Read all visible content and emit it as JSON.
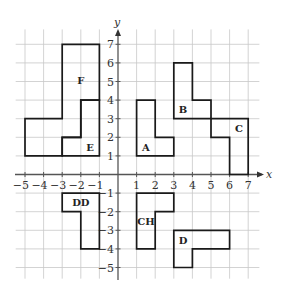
{
  "diagram": {
    "type": "coordinate-grid",
    "x_axis": {
      "label": "x",
      "ticks": [
        -5,
        -4,
        -3,
        -2,
        -1,
        1,
        2,
        3,
        4,
        5,
        6,
        7
      ]
    },
    "y_axis": {
      "label": "y",
      "ticks": [
        7,
        6,
        5,
        4,
        3,
        2,
        1,
        -1,
        -2,
        -3,
        -4,
        -5
      ]
    },
    "grid_range": {
      "xmin": -5.5,
      "xmax": 7.6,
      "ymin": -5.6,
      "ymax": 7.8
    },
    "shapes": [
      {
        "name": "F",
        "label": "F",
        "points": [
          [
            -5,
            1
          ],
          [
            -5,
            3
          ],
          [
            -3,
            3
          ],
          [
            -3,
            7
          ],
          [
            -1,
            7
          ],
          [
            -1,
            4
          ],
          [
            -2,
            4
          ],
          [
            -2,
            2
          ],
          [
            -3,
            2
          ],
          [
            -3,
            1
          ]
        ],
        "label_pos": [
          -2,
          5.1
        ]
      },
      {
        "name": "E",
        "label": "E",
        "points": [
          [
            -3,
            1
          ],
          [
            -3,
            2
          ],
          [
            -2,
            2
          ],
          [
            -2,
            4
          ],
          [
            -1,
            4
          ],
          [
            -1,
            1
          ]
        ],
        "label_pos": [
          -1.5,
          1.5
        ]
      },
      {
        "name": "A",
        "label": "A",
        "points": [
          [
            1,
            1
          ],
          [
            1,
            4
          ],
          [
            2,
            4
          ],
          [
            2,
            2
          ],
          [
            3,
            2
          ],
          [
            3,
            1
          ]
        ],
        "label_pos": [
          1.5,
          1.5
        ]
      },
      {
        "name": "B",
        "label": "B",
        "points": [
          [
            3,
            3
          ],
          [
            3,
            6
          ],
          [
            4,
            6
          ],
          [
            4,
            4
          ],
          [
            5,
            4
          ],
          [
            5,
            3
          ]
        ],
        "label_pos": [
          3.5,
          3.5
        ]
      },
      {
        "name": "C",
        "label": "C",
        "points": [
          [
            5,
            3
          ],
          [
            5,
            2
          ],
          [
            6,
            2
          ],
          [
            6,
            0
          ],
          [
            7,
            0
          ],
          [
            7,
            3
          ]
        ],
        "label_pos": [
          6.5,
          2.5
        ]
      },
      {
        "name": "DD",
        "label": "DD",
        "points": [
          [
            -3,
            -1
          ],
          [
            -3,
            -2
          ],
          [
            -2,
            -2
          ],
          [
            -2,
            -4
          ],
          [
            -1,
            -4
          ],
          [
            -1,
            -1
          ]
        ],
        "label_pos": [
          -2,
          -1.5
        ]
      },
      {
        "name": "CH",
        "label": "CH",
        "points": [
          [
            1,
            -1
          ],
          [
            1,
            -4
          ],
          [
            2,
            -4
          ],
          [
            2,
            -2
          ],
          [
            3,
            -2
          ],
          [
            3,
            -1
          ]
        ],
        "label_pos": [
          1.5,
          -2.5
        ]
      },
      {
        "name": "D",
        "label": "D",
        "points": [
          [
            3,
            -3
          ],
          [
            3,
            -5
          ],
          [
            4,
            -5
          ],
          [
            4,
            -4
          ],
          [
            6,
            -4
          ],
          [
            6,
            -3
          ]
        ],
        "label_pos": [
          3.5,
          -3.5
        ]
      }
    ]
  }
}
